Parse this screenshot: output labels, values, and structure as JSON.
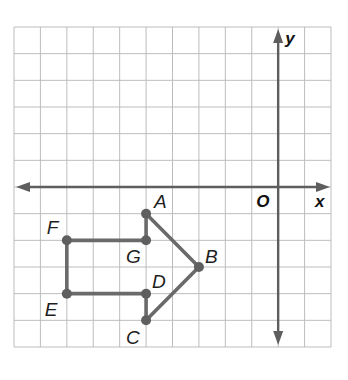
{
  "diagram": {
    "type": "coordinate-grid-figure",
    "grid": {
      "x_min": -10,
      "x_max": 2,
      "y_min": -6,
      "y_max": 6,
      "cell_px": 26.4,
      "origin_px": [
        277,
        187
      ],
      "left_px": 14,
      "top_px": 27,
      "right_px": 331,
      "bottom_px": 347,
      "grid_color": "#bdbdbd",
      "axis_color": "#5e5e5e"
    },
    "axes": {
      "x_label": "x",
      "y_label": "y",
      "origin_label": "O"
    },
    "figure": {
      "stroke_color": "#6a6a6a",
      "point_color": "#5f5f5f",
      "order": [
        "A",
        "B",
        "C",
        "D",
        "E",
        "F",
        "G"
      ],
      "points": [
        {
          "name": "A",
          "x": -5,
          "y": -1,
          "label": "A",
          "label_dx": 8,
          "label_dy": -6
        },
        {
          "name": "B",
          "x": -3,
          "y": -3,
          "label": "B",
          "label_dx": 6,
          "label_dy": -4
        },
        {
          "name": "C",
          "x": -5,
          "y": -5,
          "label": "C",
          "label_dx": -20,
          "label_dy": 24
        },
        {
          "name": "D",
          "x": -5,
          "y": -4,
          "label": "D",
          "label_dx": 6,
          "label_dy": -6
        },
        {
          "name": "E",
          "x": -8,
          "y": -4,
          "label": "E",
          "label_dx": -22,
          "label_dy": 22
        },
        {
          "name": "F",
          "x": -8,
          "y": -2,
          "label": "F",
          "label_dx": -20,
          "label_dy": -6
        },
        {
          "name": "G",
          "x": -5,
          "y": -2,
          "label": "G",
          "label_dx": -20,
          "label_dy": 23
        }
      ]
    }
  }
}
